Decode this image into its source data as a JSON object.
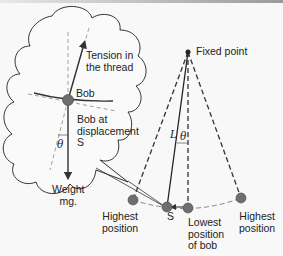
{
  "diagram": {
    "colors": {
      "line": "#333333",
      "dashed": "#888888",
      "bob": "#6e6e6e",
      "background": "#f8f8f8"
    },
    "callout": {
      "labels": {
        "tension": "Tension in\nthe thread",
        "bob": "Bob",
        "displacement": "Bob at\ndisplacement\nS",
        "theta": "θ",
        "weight": "Weight\nmg."
      }
    },
    "pendulum": {
      "labels": {
        "fixed_point": "Fixed point",
        "length": "L",
        "theta": "θ",
        "s": "S",
        "highest_left": "Highest\nposition",
        "lowest": "Lowest\nposition\nof bob",
        "highest_right": "Highest\nposition"
      }
    }
  }
}
